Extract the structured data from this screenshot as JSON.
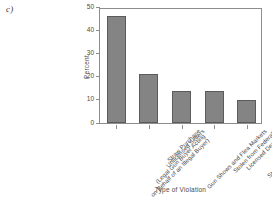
{
  "panel": {
    "label": "c)"
  },
  "chart_data": {
    "type": "bar",
    "title": "",
    "xlabel": "Type of Violation",
    "ylabel": "Percent",
    "ylim": [
      0,
      50
    ],
    "yticks": [
      0,
      10,
      20,
      30,
      40,
      50
    ],
    "ytick_labels": [
      "0",
      "10",
      "20",
      "30",
      "40",
      "50"
    ],
    "grid": false,
    "legend": false,
    "categories": [
      "Straw Purchase (Legal Gun Buyer Acting on Behalf of an Illegal Buyer)",
      "Unlicensed Sellers",
      "Gun Shows and Flea Markets",
      "Stolen from Federally Licensed Dealers",
      "Stolen from Residences"
    ],
    "category_lines": [
      [
        "Straw Purchase",
        "(Legal Gun Buyer Acting",
        "on Behalf of an Illegal Buyer)"
      ],
      [
        "Unlicensed Sellers"
      ],
      [
        "Gun Shows and Flea Markets"
      ],
      [
        "Stolen from Federally",
        "Licensed Dealers"
      ],
      [
        "Stolen from Residences"
      ]
    ],
    "values": [
      46,
      21,
      13.7,
      13.7,
      9.8
    ],
    "bar_color": "#848484",
    "bar_edge_color": "#5b5b5b",
    "axis_color": "#8d8d8d"
  }
}
